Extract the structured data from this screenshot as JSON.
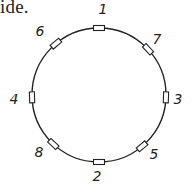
{
  "text_fragment": "ide.",
  "circle": {
    "cx": 99,
    "cy": 95,
    "r": 67,
    "stroke": "#222222"
  },
  "markers": [
    {
      "label": "1",
      "angle": 0,
      "lx": 103,
      "ly": 14
    },
    {
      "label": "7",
      "angle": 47,
      "lx": 157,
      "ly": 44
    },
    {
      "label": "3",
      "angle": 92,
      "lx": 178,
      "ly": 104
    },
    {
      "label": "5",
      "angle": 140,
      "lx": 154,
      "ly": 159
    },
    {
      "label": "2",
      "angle": 180,
      "lx": 97,
      "ly": 181
    },
    {
      "label": "8",
      "angle": 223,
      "lx": 39,
      "ly": 157
    },
    {
      "label": "4",
      "angle": 268,
      "lx": 14,
      "ly": 104
    },
    {
      "label": "6",
      "angle": 320,
      "lx": 40,
      "ly": 36
    }
  ]
}
